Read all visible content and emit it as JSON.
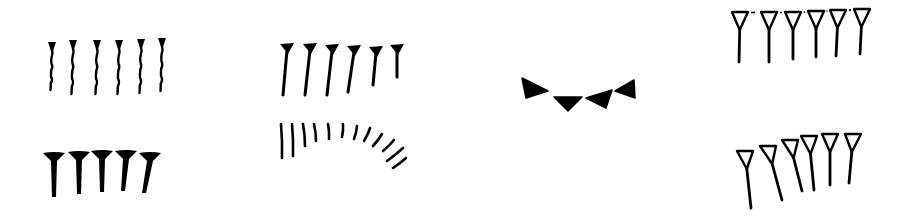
{
  "figure": {
    "width": 911,
    "height": 216,
    "background": "#ffffff",
    "ink": "#000000",
    "groups": [
      {
        "name": "thin-wedges-six",
        "style": "thin-wavy",
        "count": 6,
        "glyphs": [
          {
            "x": 52,
            "top": 42,
            "bottom": 91
          },
          {
            "x": 73,
            "top": 40,
            "bottom": 95
          },
          {
            "x": 97,
            "top": 40,
            "bottom": 95
          },
          {
            "x": 119,
            "top": 40,
            "bottom": 95
          },
          {
            "x": 141,
            "top": 39,
            "bottom": 94
          },
          {
            "x": 162,
            "top": 38,
            "bottom": 92
          }
        ]
      },
      {
        "name": "bold-wedges-five",
        "style": "bold-filled",
        "count": 5,
        "glyphs": [
          {
            "x": 54,
            "top": 153,
            "bottom": 197,
            "lean": 0
          },
          {
            "x": 79,
            "top": 152,
            "bottom": 194,
            "lean": 0
          },
          {
            "x": 102,
            "top": 151,
            "bottom": 192,
            "lean": 0
          },
          {
            "x": 126,
            "top": 151,
            "bottom": 191,
            "lean": -3
          },
          {
            "x": 150,
            "top": 153,
            "bottom": 193,
            "lean": -6
          }
        ]
      },
      {
        "name": "filled-wedges-six",
        "style": "filled-head",
        "count": 6,
        "glyphs": [
          {
            "x": 287,
            "top": 44,
            "bottom": 95,
            "lean": -4
          },
          {
            "x": 310,
            "top": 44,
            "bottom": 95,
            "lean": -5
          },
          {
            "x": 332,
            "top": 45,
            "bottom": 95,
            "lean": -5
          },
          {
            "x": 354,
            "top": 46,
            "bottom": 92,
            "lean": -6
          },
          {
            "x": 376,
            "top": 47,
            "bottom": 85,
            "lean": -3
          },
          {
            "x": 397,
            "top": 45,
            "bottom": 77,
            "lean": 0
          }
        ]
      },
      {
        "name": "arc-strokes-twelve",
        "style": "arc-strokes",
        "count": 12,
        "glyphs": [
          {
            "x1": 281,
            "y1": 124,
            "x2": 282,
            "y2": 158
          },
          {
            "x1": 292,
            "y1": 124,
            "x2": 293,
            "y2": 156
          },
          {
            "x1": 303,
            "y1": 124,
            "x2": 305,
            "y2": 146
          },
          {
            "x1": 314,
            "y1": 124,
            "x2": 316,
            "y2": 141
          },
          {
            "x1": 328,
            "y1": 124,
            "x2": 329,
            "y2": 139
          },
          {
            "x1": 343,
            "y1": 124,
            "x2": 342,
            "y2": 137
          },
          {
            "x1": 357,
            "y1": 126,
            "x2": 354,
            "y2": 139
          },
          {
            "x1": 370,
            "y1": 128,
            "x2": 364,
            "y2": 141
          },
          {
            "x1": 382,
            "y1": 134,
            "x2": 373,
            "y2": 146
          },
          {
            "x1": 394,
            "y1": 140,
            "x2": 383,
            "y2": 151
          },
          {
            "x1": 403,
            "y1": 148,
            "x2": 387,
            "y2": 161
          },
          {
            "x1": 406,
            "y1": 158,
            "x2": 393,
            "y2": 168
          }
        ]
      },
      {
        "name": "horizontal-wedges-four",
        "style": "rotated-triangles",
        "count": 4,
        "glyphs": [
          {
            "points": "522,78 526,98 548,91"
          },
          {
            "points": "554,97 582,97 568,111"
          },
          {
            "points": "586,98 612,90 606,108"
          },
          {
            "points": "615,91 634,80 635,98"
          }
        ]
      },
      {
        "name": "outlined-wedges-six",
        "style": "outlined-head",
        "count": 6,
        "glyphs": [
          {
            "x": 740,
            "top": 12,
            "bottom": 62,
            "lean": -1
          },
          {
            "x": 769,
            "top": 12,
            "bottom": 62,
            "lean": 0
          },
          {
            "x": 793,
            "top": 12,
            "bottom": 59,
            "lean": 0
          },
          {
            "x": 816,
            "top": 11,
            "bottom": 57,
            "lean": 0
          },
          {
            "x": 838,
            "top": 10,
            "bottom": 56,
            "lean": -2
          },
          {
            "x": 862,
            "top": 9,
            "bottom": 54,
            "lean": -2
          }
        ]
      },
      {
        "name": "outlined-wedges-arc-six",
        "style": "outlined-head-arc",
        "count": 6,
        "glyphs": [
          {
            "x": 745,
            "top": 151,
            "bottom": 208,
            "lean": 6
          },
          {
            "x": 768,
            "top": 146,
            "bottom": 200,
            "lean": 14
          },
          {
            "x": 790,
            "top": 140,
            "bottom": 191,
            "lean": 12
          },
          {
            "x": 809,
            "top": 136,
            "bottom": 190,
            "lean": 5
          },
          {
            "x": 830,
            "top": 134,
            "bottom": 185,
            "lean": 0
          },
          {
            "x": 853,
            "top": 134,
            "bottom": 183,
            "lean": -4
          }
        ]
      }
    ]
  }
}
